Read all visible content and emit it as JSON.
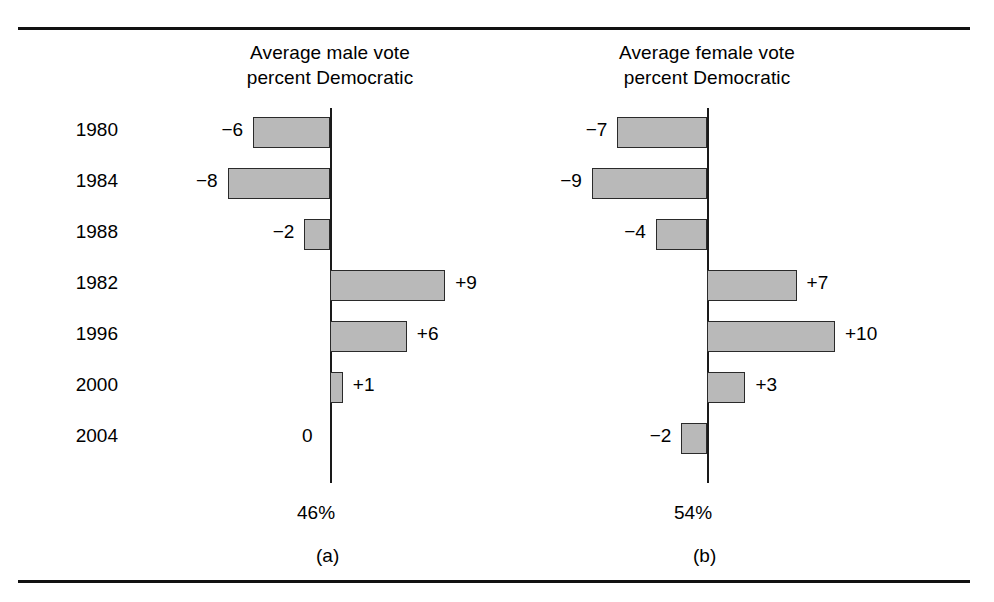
{
  "figure": {
    "background": "#ffffff",
    "rule_color": "#111111",
    "bar_fill": "#b9b9b9",
    "bar_stroke": "#2a2a2a"
  },
  "chart_data": [
    {
      "type": "bar",
      "orientation": "horizontal",
      "title": "Average male vote percent Democratic",
      "title_line1": "Average male vote",
      "title_line2": "percent Democratic",
      "caption": "(a)",
      "baseline_label": "46%",
      "baseline_value": 46,
      "xlabel": "",
      "ylabel": "",
      "grid": false,
      "legend": "none",
      "categories": [
        "1980",
        "1984",
        "1988",
        "1982",
        "1996",
        "2000",
        "2004"
      ],
      "values": [
        -6,
        -8,
        -2,
        9,
        6,
        1,
        0
      ],
      "data_labels": [
        "−6",
        "−8",
        "−2",
        "+9",
        "+6",
        "+1",
        "0"
      ],
      "xlim": [
        -10,
        10
      ]
    },
    {
      "type": "bar",
      "orientation": "horizontal",
      "title": "Average female vote percent Democratic",
      "title_line1": "Average female vote",
      "title_line2": "percent Democratic",
      "caption": "(b)",
      "baseline_label": "54%",
      "baseline_value": 54,
      "xlabel": "",
      "ylabel": "",
      "grid": false,
      "legend": "none",
      "categories": [
        "1980",
        "1984",
        "1988",
        "1982",
        "1996",
        "2000",
        "2004"
      ],
      "values": [
        -7,
        -9,
        -4,
        7,
        10,
        3,
        -2
      ],
      "data_labels": [
        "−7",
        "−9",
        "−4",
        "+7",
        "+10",
        "+3",
        "−2"
      ],
      "xlim": [
        -10,
        10
      ]
    }
  ]
}
